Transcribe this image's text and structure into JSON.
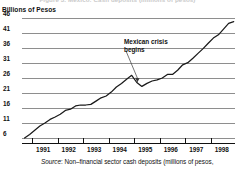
{
  "figure": {
    "cut_off_title": "Figure 3. Mexico: Cash deposits (millions of pesos)",
    "y_axis_title": "Billions of Pesos",
    "source_label": "Source",
    "source_text": ": Non–financial sector cash deposits (millions of pesos,",
    "annotation_line1": "Mexican crisis",
    "annotation_line2": "begins"
  },
  "chart_data": {
    "type": "line",
    "title": "",
    "xlabel": "",
    "ylabel": "Billions of Pesos",
    "ylim": [
      6,
      46
    ],
    "xlim": [
      1990.6,
      1998.95
    ],
    "grid": true,
    "legend": false,
    "y_ticks": [
      46,
      41,
      36,
      31,
      26,
      21,
      16,
      11,
      6
    ],
    "x_ticks": [
      1991,
      1992,
      1993,
      1994,
      1995,
      1996,
      1997,
      1998
    ],
    "categories": [
      "1990.7",
      "1990.9",
      "1991.1",
      "1991.3",
      "1991.5",
      "1991.7",
      "1991.9",
      "1992.1",
      "1992.3",
      "1992.5",
      "1992.7",
      "1992.9",
      "1993.1",
      "1993.3",
      "1993.5",
      "1993.7",
      "1993.9",
      "1994.1",
      "1994.3",
      "1994.5",
      "1994.7",
      "1994.9",
      "1995.1",
      "1995.3",
      "1995.5",
      "1995.7",
      "1995.9",
      "1996.1",
      "1996.3",
      "1996.5",
      "1996.7",
      "1996.9",
      "1997.1",
      "1997.3",
      "1997.5",
      "1997.7",
      "1997.9",
      "1998.1",
      "1998.3",
      "1998.5",
      "1998.7",
      "1998.9"
    ],
    "series": [
      {
        "name": "Non-financial sector cash deposits",
        "color": "#1a1a1a",
        "values": [
          6.0,
          7.2,
          8.6,
          10.0,
          11.0,
          12.2,
          13.0,
          13.9,
          15.2,
          15.6,
          16.7,
          17.0,
          17.0,
          17.2,
          18.3,
          19.4,
          20.0,
          21.3,
          23.0,
          24.2,
          25.6,
          26.9,
          24.5,
          23.2,
          24.2,
          25.0,
          25.4,
          26.0,
          27.2,
          27.2,
          28.6,
          30.4,
          31.1,
          32.6,
          34.2,
          35.8,
          37.6,
          39.3,
          40.4,
          42.3,
          44.2,
          44.8
        ]
      }
    ],
    "annotations": [
      {
        "text": "Mexican crisis begins",
        "points_to_x": "1995.1",
        "points_to_y": 24.0
      }
    ]
  }
}
